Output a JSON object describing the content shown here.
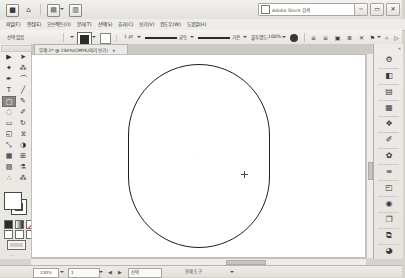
{
  "app": {
    "name": "Adobe Illustrator",
    "accent": "#1d1d1d",
    "chrome_bg": "#e8e6e1"
  },
  "titlebar": {
    "icons": [
      {
        "name": "app-logo-icon",
        "glyph": "■"
      },
      {
        "name": "home-icon",
        "glyph": "⌂"
      },
      {
        "name": "open-file-icon",
        "glyph": "▤"
      },
      {
        "name": "document-icon",
        "glyph": "▥"
      }
    ],
    "search_placeholder": "Adobe Stock 검색",
    "window_buttons": [
      {
        "name": "minimize-button",
        "glyph": "─"
      },
      {
        "name": "maximize-button",
        "glyph": "▭"
      },
      {
        "name": "close-button",
        "glyph": "✕"
      }
    ]
  },
  "menubar": {
    "items": [
      {
        "label": "파일(F)"
      },
      {
        "label": "편집(E)"
      },
      {
        "label": "오브젝트(O)"
      },
      {
        "label": "문자(T)"
      },
      {
        "label": "선택(S)"
      },
      {
        "label": "효과(C)"
      },
      {
        "label": "보기(V)"
      },
      {
        "label": "윈도우(W)"
      },
      {
        "label": "도움말(H)"
      }
    ]
  },
  "controlbar": {
    "no_selection_label": "선택 없음",
    "fill_label": "칠",
    "stroke_label": "획",
    "stroke_weight_label": "가중치:",
    "stroke_weight_value": "1 pt",
    "stroke_profile_label": "균등",
    "brush_label": "기본",
    "opacity_label": "불투명도:",
    "opacity_value": "100%",
    "style_label": "스타일:",
    "align_label": "정렬",
    "transform_label": "변형",
    "doc_setup_label": "문서 설정",
    "preferences_label": "환경 설정",
    "icons": [
      {
        "name": "fill-swatch-icon",
        "glyph": ""
      },
      {
        "name": "stroke-swatch-icon",
        "glyph": ""
      },
      {
        "name": "opacity-circle-icon",
        "glyph": "●"
      },
      {
        "name": "align-left-icon",
        "glyph": "≡"
      },
      {
        "name": "align-center-icon",
        "glyph": "≡"
      },
      {
        "name": "distribute-icon",
        "glyph": "▣"
      },
      {
        "name": "arrange-icon",
        "glyph": "≣"
      },
      {
        "name": "transform-icon",
        "glyph": "✕"
      },
      {
        "name": "isolate-icon",
        "glyph": "⚑"
      },
      {
        "name": "chevron-down-icon",
        "glyph": "▾"
      },
      {
        "name": "grid-icon",
        "glyph": "⌗"
      },
      {
        "name": "play-icon",
        "glyph": "▷"
      },
      {
        "name": "more-options-icon",
        "glyph": "≫"
      }
    ]
  },
  "document_tab": {
    "title": "무제-2* @ 230%(CMYK/미리 보기)",
    "close_glyph": "×"
  },
  "toolbar": {
    "tools": [
      {
        "name": "selection-tool",
        "glyph": "▶",
        "selected": false
      },
      {
        "name": "direct-selection-tool",
        "glyph": "➤",
        "selected": false
      },
      {
        "name": "magic-wand-tool",
        "glyph": "✦",
        "selected": false
      },
      {
        "name": "lasso-tool",
        "glyph": "⁂",
        "selected": false
      },
      {
        "name": "pen-tool",
        "glyph": "✒",
        "selected": false
      },
      {
        "name": "curvature-tool",
        "glyph": "⌒",
        "selected": false
      },
      {
        "name": "type-tool",
        "glyph": "T",
        "selected": false
      },
      {
        "name": "line-segment-tool",
        "glyph": "╱",
        "selected": false
      },
      {
        "name": "rectangle-tool",
        "glyph": "▢",
        "selected": true
      },
      {
        "name": "paintbrush-tool",
        "glyph": "✎",
        "selected": false
      },
      {
        "name": "shaper-tool",
        "glyph": "◌",
        "selected": false
      },
      {
        "name": "pencil-tool",
        "glyph": "✐",
        "selected": false
      },
      {
        "name": "eraser-tool",
        "glyph": "▭",
        "selected": false
      },
      {
        "name": "rotate-tool",
        "glyph": "↻",
        "selected": false
      },
      {
        "name": "scale-tool",
        "glyph": "◱",
        "selected": false
      },
      {
        "name": "width-tool",
        "glyph": "⧖",
        "selected": false
      },
      {
        "name": "free-transform-tool",
        "glyph": "⤡",
        "selected": false
      },
      {
        "name": "shape-builder-tool",
        "glyph": "◑",
        "selected": false
      },
      {
        "name": "perspective-grid-tool",
        "glyph": "▦",
        "selected": false
      },
      {
        "name": "mesh-tool",
        "glyph": "⊞",
        "selected": false
      },
      {
        "name": "gradient-tool",
        "glyph": "▨",
        "selected": false
      },
      {
        "name": "eyedropper-tool",
        "glyph": "⚗",
        "selected": false
      },
      {
        "name": "blend-tool",
        "glyph": "∴",
        "selected": false
      },
      {
        "name": "symbol-sprayer-tool",
        "glyph": "⁂",
        "selected": false
      },
      {
        "name": "column-graph-tool",
        "glyph": "█",
        "selected": false
      },
      {
        "name": "artboard-tool",
        "glyph": "⬚",
        "selected": false
      },
      {
        "name": "slice-tool",
        "glyph": "✂",
        "selected": false
      },
      {
        "name": "hand-tool",
        "glyph": "✋",
        "selected": false
      },
      {
        "name": "zoom-tool",
        "glyph": "⚲",
        "selected": false
      }
    ],
    "fill_color": "#ffffff",
    "stroke_color": "#1d1d1d",
    "swatches": [
      {
        "name": "color-swatch-button",
        "kind": "k"
      },
      {
        "name": "gradient-swatch-button",
        "kind": "g"
      },
      {
        "name": "none-swatch-button",
        "kind": "n"
      }
    ],
    "drawing_modes": [
      {
        "name": "draw-normal-button"
      },
      {
        "name": "draw-behind-button"
      },
      {
        "name": "draw-inside-button"
      }
    ],
    "screen_mode_name": "change-screen-mode-button",
    "more_tools_glyph": "⋯"
  },
  "canvas": {
    "zoom_label": "230%",
    "shape": {
      "name": "rounded-rectangle-path",
      "left": 96,
      "top": 9,
      "width": 142,
      "height": 184,
      "radius": 71,
      "stroke": "#1d1d1d",
      "fill": "none"
    },
    "center_point_glyph": "·",
    "cursor": {
      "x": 244,
      "y": 173,
      "name": "crosshair-cursor"
    }
  },
  "dock": {
    "collapse_glyph": "«",
    "panels": [
      {
        "name": "panel-properties",
        "glyph": "⚙",
        "label": "속성"
      },
      {
        "name": "panel-libraries",
        "glyph": "◧",
        "label": "라이브러리"
      },
      {
        "name": "panel-color",
        "glyph": "▤",
        "label": "색상"
      },
      {
        "name": "panel-color-guide",
        "glyph": "▦",
        "label": "색상 가이드"
      },
      {
        "name": "panel-swatches",
        "glyph": "❖",
        "label": "견본"
      },
      {
        "name": "panel-brushes",
        "glyph": "✐",
        "label": "브러시"
      },
      {
        "name": "panel-symbols",
        "glyph": "✿",
        "label": "심볼"
      },
      {
        "name": "panel-stroke",
        "glyph": "≡",
        "label": "획"
      },
      {
        "name": "panel-transparency",
        "glyph": "◰",
        "label": "투명도"
      },
      {
        "name": "panel-appearance",
        "glyph": "◉",
        "label": "모양"
      },
      {
        "name": "panel-artboards",
        "glyph": "❐",
        "label": "대지"
      },
      {
        "name": "panel-layers",
        "glyph": "⧉",
        "label": "레이어"
      },
      {
        "name": "panel-align",
        "glyph": "◨",
        "label": "정렬"
      },
      {
        "name": "panel-pathfinder",
        "glyph": "◕",
        "label": "패스파인더"
      }
    ]
  },
  "statusbar": {
    "zoom_value": "230%",
    "artboard_value": "1",
    "tool_value": "선택",
    "status_text": "현재 도구",
    "nav_prev_glyph": "◀",
    "nav_next_glyph": "▶",
    "caret_glyph": "▾"
  }
}
